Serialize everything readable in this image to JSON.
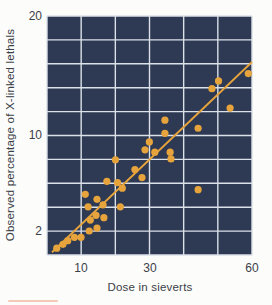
{
  "figure": {
    "xlabel": "Dose in sieverts",
    "ylabel": "Observed percentage of X-linked lethals"
  },
  "chart_data": {
    "type": "scatter",
    "title": "",
    "xlabel": "Dose in sieverts",
    "ylabel": "Observed percentage of X-linked lethals",
    "x_scale": "log",
    "y_scale": "log",
    "x_ticks": [
      10,
      30,
      60
    ],
    "y_ticks": [
      2,
      10,
      20
    ],
    "xlim": [
      5.4,
      60
    ],
    "ylim": [
      1.3,
      20
    ],
    "grid": true,
    "points": [
      {
        "x": 6.8,
        "y": 1.5
      },
      {
        "x": 7.5,
        "y": 1.6
      },
      {
        "x": 8.1,
        "y": 1.7
      },
      {
        "x": 9.0,
        "y": 1.8
      },
      {
        "x": 10.0,
        "y": 1.8
      },
      {
        "x": 11.4,
        "y": 2.0
      },
      {
        "x": 12.9,
        "y": 2.1
      },
      {
        "x": 10.7,
        "y": 3.7
      },
      {
        "x": 12.9,
        "y": 3.4
      },
      {
        "x": 11.2,
        "y": 3.0
      },
      {
        "x": 14.2,
        "y": 3.1
      },
      {
        "x": 12.7,
        "y": 2.6
      },
      {
        "x": 14.4,
        "y": 2.5
      },
      {
        "x": 11.6,
        "y": 2.4
      },
      {
        "x": 17.3,
        "y": 6.6
      },
      {
        "x": 23.6,
        "y": 5.6
      },
      {
        "x": 26.4,
        "y": 4.9
      },
      {
        "x": 15.1,
        "y": 4.6
      },
      {
        "x": 17.9,
        "y": 4.5
      },
      {
        "x": 19.3,
        "y": 4.1
      },
      {
        "x": 18.7,
        "y": 3.0
      },
      {
        "x": 29.7,
        "y": 8.9
      },
      {
        "x": 27.7,
        "y": 7.8
      },
      {
        "x": 31.0,
        "y": 7.5
      },
      {
        "x": 34.4,
        "y": 7.5
      },
      {
        "x": 34.6,
        "y": 6.7
      },
      {
        "x": 33.2,
        "y": 10.9
      },
      {
        "x": 33.2,
        "y": 10.1
      },
      {
        "x": 41.6,
        "y": 10.4
      },
      {
        "x": 51.7,
        "y": 11.7
      },
      {
        "x": 45.7,
        "y": 13.1
      },
      {
        "x": 47.8,
        "y": 13.7
      },
      {
        "x": 58.5,
        "y": 14.3
      },
      {
        "x": 41.6,
        "y": 4.0
      }
    ],
    "trend_line": {
      "x1": 6.3,
      "y1": 1.4,
      "x2": 60,
      "y2": 15.3
    },
    "colors": {
      "plot_bg": "#2e3a53",
      "grid": "#dce1e9",
      "marker": "#e7a43c",
      "line": "#e7a43c",
      "text": "#3b4046",
      "page_bg": "#fcfcfb",
      "artifact": "#f2bba6"
    }
  }
}
